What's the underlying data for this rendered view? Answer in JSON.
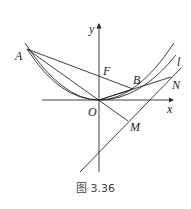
{
  "figure": {
    "caption": "图 3.36",
    "labels": {
      "y_axis": "y",
      "x_axis": "x",
      "A": "A",
      "F": "F",
      "B": "B",
      "O": "O",
      "N": "N",
      "M": "M",
      "l": "l"
    },
    "colors": {
      "stroke": "#2a2a2a",
      "background": "#ffffff"
    }
  }
}
